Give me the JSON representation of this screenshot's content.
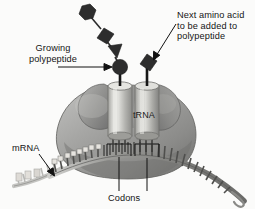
{
  "figure": {
    "background_color": "#fbfbfa",
    "width": 255,
    "height": 209
  },
  "labels": {
    "growing_polypeptide": "Growing\npolypeptide",
    "next_amino_acid": "Next amino acid\nto be added to\npolypeptide",
    "mrna": "mRNA",
    "codons": "Codons",
    "trna": "tRNA"
  },
  "colors": {
    "text": "#141414",
    "amino_acid_fill": "#2d2d2d",
    "ribosome_light": "#b9b9b9",
    "ribosome_mid": "#9a9a9a",
    "ribosome_dark": "#6f6f6f",
    "trna_cylinder_light": "#d8d8d4",
    "trna_cylinder_mid": "#aaaaa6",
    "mrna_strand": "#8c8c8c",
    "mrna_faded": "#c9c9c6",
    "leader_line": "#1a1a1a"
  },
  "elements": {
    "polypeptide_chain": [
      {
        "shape": "hexagon",
        "order": 1
      },
      {
        "shape": "diamond",
        "order": 2
      },
      {
        "shape": "triangle",
        "order": 3
      },
      {
        "shape": "circle",
        "order": 4
      }
    ],
    "next_amino_acid_shape": "diamond",
    "trna_count": 2,
    "codon_brackets": 2
  }
}
